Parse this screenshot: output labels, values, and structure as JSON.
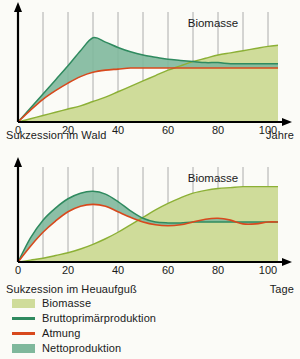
{
  "figure": {
    "title_visible": false,
    "background": "#fbfbf7",
    "colors": {
      "biomass_fill": "#cfdc9a",
      "biomass_line": "#8cb036",
      "gross_production_line": "#2f8a5f",
      "respiration_line": "#d8491d",
      "net_production_fill": "#7fb89c",
      "axis": "#000000",
      "gridline": "#9a9a9a",
      "text": "#1a1a1a"
    }
  },
  "legend": {
    "position": "below-charts",
    "items": [
      {
        "label": "Biomasse",
        "marker": "swatch",
        "color": "#cfdc9a"
      },
      {
        "label": "Bruttoprimärproduktion",
        "marker": "line",
        "color": "#2f8a5f"
      },
      {
        "label": "Atmung",
        "marker": "line",
        "color": "#d8491d"
      },
      {
        "label": "Nettoproduktion",
        "marker": "swatch",
        "color": "#7fb89c"
      }
    ]
  },
  "chart_data": [
    {
      "id": "succession-forest",
      "type": "area",
      "title": "",
      "caption_left": "Sukzession im Wald",
      "caption_right": "Jahre",
      "xlabel": "Jahre",
      "ylabel": "",
      "annotations": [
        {
          "text": "Biomasse",
          "x": 78,
          "y": 88
        }
      ],
      "grid": true,
      "grid_x_every": 10,
      "xlim": [
        0,
        104
      ],
      "ylim": [
        0,
        100
      ],
      "xticks": [
        0,
        20,
        40,
        60,
        80,
        100
      ],
      "xticklabels": [
        "0",
        "20",
        "40",
        "60",
        "80",
        "100"
      ],
      "x": [
        0,
        5,
        10,
        15,
        20,
        25,
        30,
        35,
        40,
        45,
        50,
        55,
        60,
        65,
        70,
        75,
        80,
        85,
        90,
        95,
        100,
        104
      ],
      "series": [
        {
          "name": "Biomasse",
          "kind": "area",
          "fill": "#cfdc9a",
          "line": "#8cb036",
          "values": [
            0,
            3,
            6,
            9,
            12,
            15,
            19,
            23,
            28,
            33,
            38,
            43,
            48,
            52,
            56,
            59,
            62,
            64,
            66,
            68,
            70,
            71
          ]
        },
        {
          "name": "Bruttoprimärproduktion",
          "kind": "line",
          "line": "#2f8a5f",
          "values": [
            0,
            13,
            26,
            39,
            52,
            66,
            78,
            74,
            69,
            65,
            62,
            60,
            58,
            57,
            56,
            55,
            55,
            54,
            54,
            54,
            54,
            54
          ]
        },
        {
          "name": "Atmung",
          "kind": "line",
          "line": "#d8491d",
          "values": [
            0,
            11,
            21,
            29,
            36,
            42,
            46,
            48,
            49,
            50,
            50,
            50,
            50,
            50,
            50,
            50,
            50,
            50,
            50,
            50,
            50,
            50
          ]
        },
        {
          "name": "Nettoproduktion",
          "kind": "band",
          "fill": "#7fb89c",
          "between": [
            "Bruttoprimärproduktion",
            "Atmung"
          ]
        }
      ]
    },
    {
      "id": "succession-hay-infusion",
      "type": "area",
      "title": "",
      "caption_left": "Sukzession im Heuaufguß",
      "caption_right": "Tage",
      "xlabel": "Tage",
      "ylabel": "",
      "annotations": [
        {
          "text": "Biomasse",
          "x": 78,
          "y": 86
        }
      ],
      "grid": true,
      "grid_x_every": 10,
      "xlim": [
        0,
        104
      ],
      "ylim": [
        0,
        100
      ],
      "xticks": [
        0,
        20,
        40,
        60,
        80,
        100
      ],
      "xticklabels": [
        "0",
        "20",
        "40",
        "60",
        "80",
        "100"
      ],
      "x": [
        0,
        5,
        10,
        15,
        20,
        25,
        30,
        35,
        40,
        45,
        50,
        55,
        60,
        65,
        70,
        75,
        80,
        85,
        90,
        95,
        100,
        104
      ],
      "series": [
        {
          "name": "Biomasse",
          "kind": "area",
          "fill": "#cfdc9a",
          "line": "#8cb036",
          "values": [
            0,
            2,
            4,
            7,
            10,
            14,
            19,
            25,
            32,
            40,
            48,
            56,
            63,
            69,
            74,
            77,
            79,
            80,
            81,
            81,
            81,
            81
          ]
        },
        {
          "name": "Bruttoprimärproduktion",
          "kind": "line",
          "line": "#2f8a5f",
          "values": [
            0,
            26,
            45,
            58,
            68,
            74,
            76,
            73,
            65,
            55,
            47,
            43,
            42,
            42,
            43,
            43,
            43,
            43,
            43,
            43,
            43,
            43
          ]
        },
        {
          "name": "Atmung",
          "kind": "line",
          "line": "#d8491d",
          "values": [
            0,
            17,
            32,
            44,
            54,
            60,
            62,
            60,
            54,
            48,
            43,
            40,
            39,
            40,
            43,
            46,
            47,
            45,
            41,
            41,
            43,
            43
          ]
        },
        {
          "name": "Nettoproduktion",
          "kind": "band",
          "fill": "#7fb89c",
          "between": [
            "Bruttoprimärproduktion",
            "Atmung"
          ]
        }
      ]
    }
  ]
}
